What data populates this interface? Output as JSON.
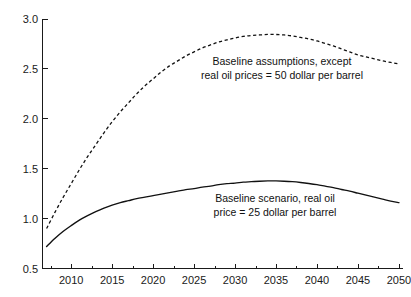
{
  "chart_data": {
    "type": "line",
    "title": "",
    "subtitle": "",
    "xlabel": "",
    "ylabel": "",
    "xlim": [
      2006.5,
      2050.5
    ],
    "ylim": [
      0.5,
      3.0
    ],
    "grid": false,
    "legend_position": "inline-annotations",
    "y_ticks": [
      "0.5",
      "1.0",
      "1.5",
      "2.0",
      "2.5",
      "3.0"
    ],
    "y_tick_values": [
      0.5,
      1.0,
      1.5,
      2.0,
      2.5,
      3.0
    ],
    "x_ticks": [
      "2010",
      "2015",
      "2020",
      "2025",
      "2030",
      "2035",
      "2040",
      "2045",
      "2050"
    ],
    "x_tick_values": [
      2010,
      2015,
      2020,
      2025,
      2030,
      2035,
      2040,
      2045,
      2050
    ],
    "x_minor_tick_values": [
      2007.5,
      2012.5,
      2017.5,
      2022.5,
      2027.5,
      2032.5,
      2037.5,
      2042.5,
      2047.5
    ],
    "x": [
      2007,
      2008,
      2009,
      2010,
      2011,
      2012,
      2013,
      2014,
      2015,
      2016,
      2017,
      2018,
      2019,
      2020,
      2021,
      2022,
      2023,
      2024,
      2025,
      2026,
      2027,
      2028,
      2029,
      2030,
      2031,
      2032,
      2033,
      2034,
      2035,
      2036,
      2037,
      2038,
      2039,
      2040,
      2041,
      2042,
      2043,
      2044,
      2045,
      2046,
      2047,
      2048,
      2049,
      2050
    ],
    "series": [
      {
        "name": "Baseline assumptions, except real oil prices = 50 dollar per barrel",
        "style": "dashed",
        "color": "#111111",
        "values": [
          0.9,
          1.06,
          1.21,
          1.35,
          1.49,
          1.62,
          1.74,
          1.86,
          1.97,
          2.07,
          2.16,
          2.25,
          2.33,
          2.4,
          2.47,
          2.53,
          2.58,
          2.63,
          2.67,
          2.71,
          2.74,
          2.77,
          2.79,
          2.81,
          2.825,
          2.835,
          2.84,
          2.845,
          2.845,
          2.84,
          2.83,
          2.815,
          2.8,
          2.78,
          2.755,
          2.73,
          2.7,
          2.67,
          2.64,
          2.62,
          2.6,
          2.58,
          2.565,
          2.55
        ]
      },
      {
        "name": "Baseline scenario, real oil price = 25 dollar per barrel",
        "style": "solid",
        "color": "#111111",
        "values": [
          0.72,
          0.8,
          0.87,
          0.93,
          0.985,
          1.03,
          1.07,
          1.105,
          1.135,
          1.16,
          1.18,
          1.2,
          1.215,
          1.23,
          1.245,
          1.26,
          1.275,
          1.29,
          1.3,
          1.315,
          1.325,
          1.34,
          1.35,
          1.355,
          1.365,
          1.37,
          1.375,
          1.378,
          1.378,
          1.375,
          1.37,
          1.362,
          1.352,
          1.34,
          1.325,
          1.31,
          1.292,
          1.275,
          1.255,
          1.235,
          1.215,
          1.195,
          1.175,
          1.16
        ]
      }
    ],
    "annotations": [
      {
        "id": "annotation-50-dollar",
        "lines": [
          "Baseline assumptions, except",
          "real oil prices = 50 dollar per barrel"
        ],
        "x_px": 282,
        "y_px": 68
      },
      {
        "id": "annotation-25-dollar",
        "lines": [
          "Baseline scenario, real oil",
          "price = 25 dollar per barrel"
        ],
        "x_px": 275,
        "y_px": 205
      }
    ]
  }
}
